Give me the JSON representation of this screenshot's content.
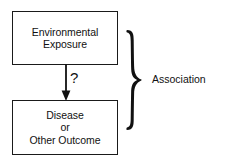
{
  "diagram": {
    "background_color": "#ffffff",
    "stroke_color": "#1a1a1a",
    "text_color": "#111111",
    "nodes": [
      {
        "id": "exposure",
        "name": "environmental-exposure-box",
        "lines": [
          "Environmental",
          "Exposure"
        ]
      },
      {
        "id": "outcome",
        "name": "disease-or-other-outcome-box",
        "lines": [
          "Disease",
          "or",
          "Other Outcome"
        ]
      }
    ],
    "connector": {
      "name": "downward-arrow",
      "direction": "down",
      "from": "exposure",
      "to": "outcome",
      "label": "?"
    },
    "brace": {
      "name": "right-curly-brace",
      "glyph": "}",
      "spans": [
        "exposure",
        "outcome"
      ]
    },
    "annotation": {
      "name": "association-label",
      "text": "Association"
    }
  }
}
